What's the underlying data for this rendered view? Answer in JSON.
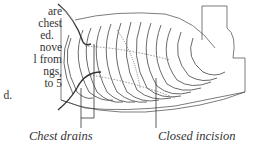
{
  "body_text": {
    "lines": [
      "are",
      "chest",
      "ed.",
      "nove",
      "l from",
      "ngs,",
      "to 5",
      "d."
    ]
  },
  "figure": {
    "labels": {
      "chest_drains": "Chest drains",
      "closed_incision": "Closed incision"
    }
  }
}
